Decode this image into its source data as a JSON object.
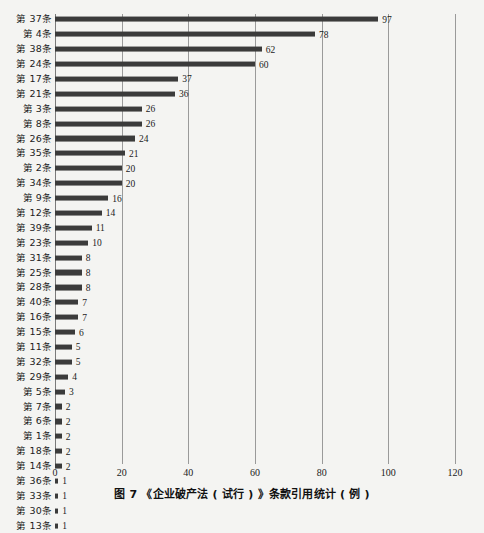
{
  "top_fragment": "",
  "caption": "图 7  《企业破产法 ( 试行 ) 》条款引用统计 ( 例 )",
  "colors": {
    "bar": "#3b3b3b",
    "gridline": "#9a9a9a",
    "background": "#f4f4f2",
    "text": "#1b1b1b"
  },
  "chart_data": {
    "type": "bar",
    "orientation": "horizontal",
    "title": "图 7  《企业破产法 ( 试行 ) 》条款引用统计 ( 例 )",
    "xlabel": "",
    "ylabel": "",
    "xlim": [
      0,
      120
    ],
    "xticks": [
      0,
      20,
      40,
      60,
      80,
      100,
      120
    ],
    "grid": true,
    "legend": false,
    "categories": [
      "第 37条",
      "第 4条",
      "第 38条",
      "第 24条",
      "第 17条",
      "第 21条",
      "第 3条",
      "第 8条",
      "第 26条",
      "第 35条",
      "第 2条",
      "第 34条",
      "第 9条",
      "第 12条",
      "第 39条",
      "第 23条",
      "第 31条",
      "第 25条",
      "第 28条",
      "第 40条",
      "第 16条",
      "第 15条",
      "第 11条",
      "第 32条",
      "第 29条",
      "第 5条",
      "第 7条",
      "第 6条",
      "第 1条",
      "第 18条",
      "第 14条",
      "第 36条",
      "第 33条",
      "第 30条",
      "第 13条"
    ],
    "values": [
      97,
      78,
      62,
      60,
      37,
      36,
      26,
      26,
      24,
      21,
      20,
      20,
      16,
      14,
      11,
      10,
      8,
      8,
      8,
      7,
      7,
      6,
      5,
      5,
      4,
      3,
      2,
      2,
      2,
      2,
      2,
      1,
      1,
      1,
      1
    ]
  }
}
